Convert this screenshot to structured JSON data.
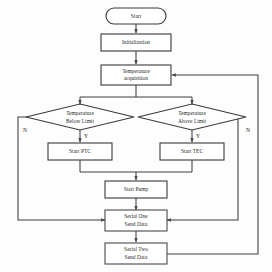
{
  "diagram": {
    "type": "flowchart",
    "background_color": "#fdfdfd",
    "line_color": "#3f3f3f",
    "text_color": "#262626",
    "nodes": {
      "start": {
        "label": "Start",
        "shape": "terminator"
      },
      "initialization": {
        "label": "Initialization",
        "shape": "process"
      },
      "temperature_acquisition": {
        "line1": "Temperature",
        "line2": "acquisition",
        "shape": "process"
      },
      "decision_below": {
        "line1": "Temperature",
        "line2": "Below Limit",
        "shape": "decision"
      },
      "decision_above": {
        "line1": "Temperature",
        "line2": "Above Limit",
        "shape": "decision"
      },
      "start_ptc": {
        "label": "Start PTC",
        "shape": "process"
      },
      "start_tec": {
        "label": "Start TEC",
        "shape": "process"
      },
      "start_pump": {
        "label": "Start Pump",
        "shape": "process"
      },
      "serial_one": {
        "line1": "Serial One",
        "line2": "Send Data",
        "shape": "process"
      },
      "serial_two": {
        "line1": "Serial Two",
        "line2": "Send Data",
        "shape": "process"
      }
    },
    "branch_labels": {
      "below_yes": "Y",
      "below_no": "N",
      "above_yes": "Y",
      "above_no": "N"
    }
  }
}
